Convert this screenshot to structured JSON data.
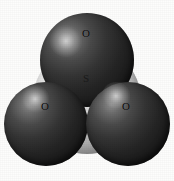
{
  "figure": {
    "kind": "space-filling-molecular-model",
    "molecule_formula": "SO3",
    "molecule_name": "sulfur trioxide",
    "background_color": "#fdfdfc",
    "caption_text": "",
    "atoms": [
      {
        "id": "oxygen-top",
        "element_symbol": "O",
        "element_name": "oxygen",
        "color": "#2b2b2b",
        "label_color": "#0a0a0a",
        "position": "top",
        "cx": 86.5,
        "cy": 60,
        "r": 47,
        "label_x": 86,
        "label_y": 34,
        "highlight_x": 66,
        "highlight_y": 41,
        "highlight_r": 16
      },
      {
        "id": "oxygen-lower-left",
        "element_symbol": "O",
        "element_name": "oxygen",
        "color": "#2b2b2b",
        "label_color": "#0a0a0a",
        "position": "lower-left",
        "cx": 46,
        "cy": 124,
        "r": 42,
        "label_x": 45,
        "label_y": 107,
        "highlight_x": 35,
        "highlight_y": 99,
        "highlight_r": 14
      },
      {
        "id": "oxygen-lower-right",
        "element_symbol": "O",
        "element_name": "oxygen",
        "color": "#2b2b2b",
        "label_color": "#0a0a0a",
        "position": "lower-right",
        "cx": 128,
        "cy": 124,
        "r": 42,
        "label_x": 126,
        "label_y": 107,
        "highlight_x": 116,
        "highlight_y": 96,
        "highlight_r": 14
      },
      {
        "id": "sulfur-center",
        "element_symbol": "S",
        "element_name": "sulfur",
        "color": "#cfcfcf",
        "label_color": "#1a1a1a",
        "position": "center",
        "cx": 87,
        "cy": 100,
        "r": 54,
        "label_x": 86,
        "label_y": 79,
        "highlight_x": 64,
        "highlight_y": 72,
        "highlight_r": 20
      }
    ]
  }
}
